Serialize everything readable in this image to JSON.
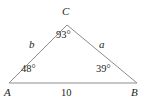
{
  "figure": {
    "type": "geometry-diagram",
    "shape": "triangle",
    "stroke_color": "#8c8c8c",
    "text_color": "#231f20",
    "background_color": "#ffffff",
    "width": 146,
    "height": 107
  },
  "vertices": {
    "apex": {
      "label": "C",
      "x": 67,
      "y": 25
    },
    "left": {
      "label": "A",
      "x": 9,
      "y": 83
    },
    "right": {
      "label": "B",
      "x": 137,
      "y": 83
    }
  },
  "angles": {
    "at_C": "93°",
    "at_A": "48°",
    "at_B": "39°"
  },
  "sides": {
    "left_side": "b",
    "right_side": "a",
    "base": "10"
  }
}
